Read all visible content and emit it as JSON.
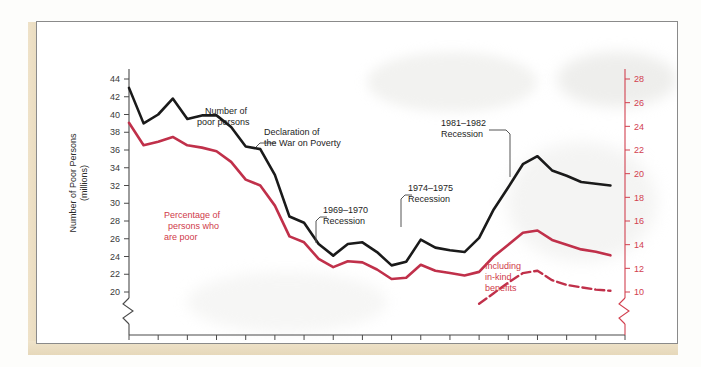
{
  "chart_data": {
    "type": "line",
    "title": "",
    "xlabel": "",
    "ylabel": "Number of Poor Persons (millions)",
    "ylabel_right": "Percentage of Persons Who Are Poor",
    "xlim": [
      1955,
      1989
    ],
    "ylim": [
      20,
      44
    ],
    "ylim_right": [
      10,
      28
    ],
    "axis_break": true,
    "grid": false,
    "legend_position": "inline-annotations",
    "xticks": [
      1955,
      1957,
      1959,
      1961,
      1963,
      1965,
      1967,
      1969,
      1971,
      1973,
      1975,
      1977,
      1979,
      1981,
      1983,
      1985,
      1987,
      1989
    ],
    "yticks_left": [
      20,
      22,
      24,
      26,
      28,
      30,
      32,
      34,
      36,
      38,
      40,
      42,
      44
    ],
    "yticks_right": [
      10,
      12,
      14,
      16,
      18,
      20,
      22,
      24,
      26,
      28
    ],
    "colors": {
      "number_poor": "#1a1a1a",
      "percentage_poor": "#c0304a",
      "axis_right": "#d2404f"
    },
    "x": [
      1955,
      1956,
      1957,
      1958,
      1959,
      1960,
      1961,
      1962,
      1963,
      1964,
      1965,
      1966,
      1967,
      1968,
      1969,
      1970,
      1971,
      1972,
      1973,
      1974,
      1975,
      1976,
      1977,
      1978,
      1979,
      1980,
      1981,
      1982,
      1983,
      1984,
      1985,
      1986,
      1987,
      1988
    ],
    "series": [
      {
        "name": "Number of poor persons",
        "axis": "left",
        "units": "millions",
        "color": "#1a1a1a",
        "values": [
          43.0,
          39.0,
          40.0,
          41.8,
          39.5,
          39.9,
          39.9,
          38.6,
          36.4,
          36.1,
          33.2,
          28.5,
          27.8,
          25.4,
          24.1,
          25.4,
          25.6,
          24.5,
          23.0,
          23.4,
          25.9,
          25.0,
          24.7,
          24.5,
          26.1,
          29.3,
          31.8,
          34.4,
          35.3,
          33.7,
          33.1,
          32.4,
          32.2,
          32.0
        ]
      },
      {
        "name": "Percentage of persons who are poor",
        "axis": "right",
        "units": "percent",
        "color": "#c0304a",
        "values": [
          24.3,
          22.4,
          22.7,
          23.1,
          22.4,
          22.2,
          21.9,
          21.0,
          19.5,
          19.0,
          17.3,
          14.7,
          14.2,
          12.8,
          12.1,
          12.6,
          12.5,
          11.9,
          11.1,
          11.2,
          12.3,
          11.8,
          11.6,
          11.4,
          11.7,
          13.0,
          14.0,
          15.0,
          15.2,
          14.4,
          14.0,
          13.6,
          13.4,
          13.1
        ]
      },
      {
        "name": "Including in-kind benefits",
        "axis": "right",
        "units": "percent",
        "color": "#c0304a",
        "style": "dashed",
        "x": [
          1979,
          1980,
          1981,
          1982,
          1983,
          1984,
          1985,
          1986,
          1987,
          1988
        ],
        "values": [
          9.0,
          9.9,
          10.8,
          11.6,
          11.8,
          11.0,
          10.6,
          10.4,
          10.2,
          10.1
        ]
      }
    ],
    "annotations": [
      {
        "id": "number-poor-persons",
        "text": "Number of\npoor persons",
        "color": "#1d1d1d",
        "line": 1,
        "line2": "poor persons"
      },
      {
        "id": "declaration-war-poverty",
        "text": "Declaration of\nthe War on Poverty",
        "color": "#1d1d1d",
        "has_leader": true
      },
      {
        "id": "percentage-persons-poor",
        "text": "Percentage of\npersons who\nare poor",
        "color": "#cf3a4a"
      },
      {
        "id": "recession-1969-1970",
        "text": "1969–1970\nRecession",
        "color": "#1d1d1d",
        "has_leader": true
      },
      {
        "id": "recession-1974-1975",
        "text": "1974–1975\nRecession",
        "color": "#1d1d1d",
        "has_leader": true
      },
      {
        "id": "recession-1981-1982",
        "text": "1981–1982\nRecession",
        "color": "#1d1d1d",
        "has_leader": true
      },
      {
        "id": "including-in-kind-benefits",
        "text": "Including\nin-kind\nbenefits",
        "color": "#cf3a4a"
      }
    ]
  },
  "axes": {
    "left_label_line1": "Number of Poor Persons",
    "left_label_line2": "(millions)",
    "right_label": "Percentage of Persons Who Are Poor"
  },
  "annotations": {
    "number_poor_1": "Number of",
    "number_poor_2": "poor persons",
    "declaration_1": "Declaration of",
    "declaration_2": "the War on Poverty",
    "percentage_1": "Percentage of",
    "percentage_2": "persons who",
    "percentage_3": "are poor",
    "rec6970_1": "1969–1970",
    "rec6970_2": "Recession",
    "rec7475_1": "1974–1975",
    "rec7475_2": "Recession",
    "rec8182_1": "1981–1982",
    "rec8182_2": "Recession",
    "inkind_1": "Including",
    "inkind_2": "in-kind",
    "inkind_3": "benefits"
  }
}
